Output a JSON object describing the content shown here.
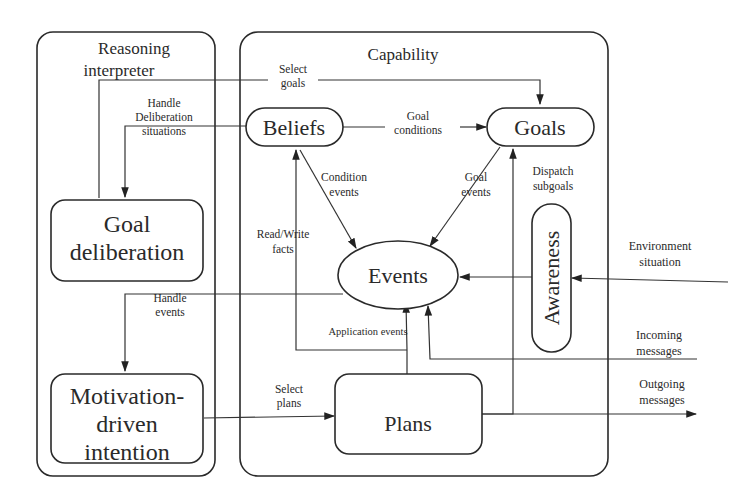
{
  "containers": {
    "reasoning_interpreter": {
      "title_line1": "Reasoning",
      "title_line2": "interpreter"
    },
    "capability": {
      "title": "Capability"
    }
  },
  "nodes": {
    "goal_deliberation": {
      "line1": "Goal",
      "line2": "deliberation"
    },
    "motivation_driven_intention": {
      "line1": "Motivation-",
      "line2": "driven",
      "line3": "intention"
    },
    "beliefs": {
      "label": "Beliefs"
    },
    "goals": {
      "label": "Goals"
    },
    "events": {
      "label": "Events"
    },
    "awareness": {
      "label": "Awareness"
    },
    "plans": {
      "label": "Plans"
    }
  },
  "edges": {
    "select_goals": {
      "line1": "Select",
      "line2": "goals"
    },
    "handle_deliberation": {
      "line1": "Handle",
      "line2": "Deliberation",
      "line3": "situations"
    },
    "goal_conditions": {
      "line1": "Goal",
      "line2": "conditions"
    },
    "condition_events": {
      "line1": "Condition",
      "line2": "events"
    },
    "goal_events": {
      "line1": "Goal",
      "line2": "events"
    },
    "dispatch_subgoals": {
      "line1": "Dispatch",
      "line2": "subgoals"
    },
    "read_write_facts": {
      "line1": "Read/Write",
      "line2": "facts"
    },
    "handle_events": {
      "line1": "Handle",
      "line2": "events"
    },
    "application_events": {
      "label": "Application events"
    },
    "select_plans": {
      "line1": "Select",
      "line2": "plans"
    }
  },
  "external": {
    "environment_situation": {
      "line1": "Environment",
      "line2": "situation"
    },
    "incoming_messages": {
      "line1": "Incoming",
      "line2": "messages"
    },
    "outgoing_messages": {
      "line1": "Outgoing",
      "line2": "messages"
    }
  }
}
